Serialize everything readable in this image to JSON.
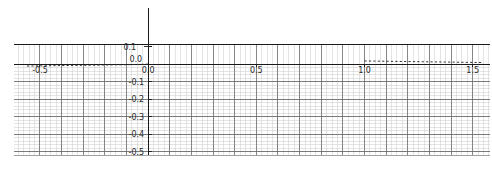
{
  "chart_data": {
    "type": "line",
    "title": "",
    "xlabel": "",
    "ylabel": "",
    "xlim": [
      -0.62,
      1.58
    ],
    "ylim": [
      -0.52,
      0.115
    ],
    "grid": true,
    "grid_minor": true,
    "legend": "none",
    "xticks": [
      -0.5,
      0.0,
      0.5,
      1.0,
      1.5
    ],
    "xticklabels": [
      "-0.5",
      "0.0",
      "0.5",
      "1.0",
      "1.5"
    ],
    "yticks": [
      0.1,
      0.0,
      -0.1,
      -0.2,
      -0.3,
      -0.4,
      -0.5
    ],
    "yticklabels": [
      "0.1",
      "0.0",
      "-0.1",
      "-0.2",
      "-0.3",
      "-0.4",
      "-0.5"
    ],
    "series": [
      {
        "name": "dashed-curve-left",
        "style": "dashed",
        "color": "#333333",
        "x": [
          -0.56,
          -0.5,
          -0.44,
          -0.38,
          -0.32,
          -0.26,
          -0.2,
          -0.14,
          -0.08,
          -0.02,
          0.0
        ],
        "y": [
          -0.011,
          -0.01,
          -0.009,
          -0.008,
          -0.007,
          -0.006,
          -0.005,
          -0.004,
          -0.003,
          -0.001,
          0.0
        ]
      },
      {
        "name": "dashed-curve-right",
        "style": "dashed",
        "color": "#333333",
        "x": [
          1.0,
          1.06,
          1.12,
          1.18,
          1.24,
          1.3,
          1.36,
          1.42,
          1.48,
          1.54
        ],
        "y": [
          0.018,
          0.017,
          0.016,
          0.015,
          0.014,
          0.013,
          0.012,
          0.011,
          0.01,
          0.009
        ]
      },
      {
        "name": "zero-line",
        "style": "solid",
        "color": "#111111",
        "x": [
          -0.62,
          1.58
        ],
        "y": [
          0.0,
          0.0
        ]
      }
    ],
    "axis_lines": {
      "vertical_axis_x": 0.0,
      "vertical_axis_ymin": -0.52,
      "vertical_axis_ymax": 0.115,
      "horizontal_axis_y": 0.0
    },
    "top_label": "0.1",
    "origin_label": "0.0"
  },
  "figure": {
    "background": "#ffffff",
    "grid_minor_color": "#c9c9c9",
    "grid_major_color": "#6e6e6e",
    "axis_color": "#1a1a1a",
    "text_color": "#2b2b2b"
  }
}
